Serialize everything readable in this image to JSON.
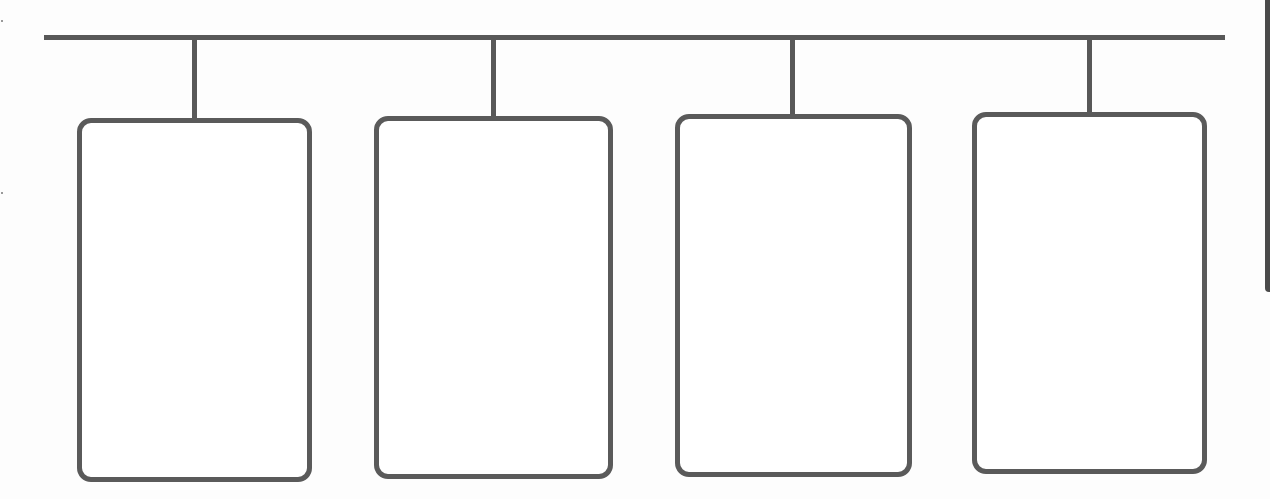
{
  "diagram": {
    "type": "org-chart-template",
    "colors": {
      "line": "#585858",
      "box_border": "#5a5a5a",
      "box_fill": "#ffffff",
      "background": "#fdfdfd",
      "edge_strip": "#4a4a4a"
    },
    "root_bar": {
      "x1": 44,
      "x2": 1225,
      "y": 35,
      "thickness": 5
    },
    "nodes": [
      {
        "id": "node-1",
        "label": "",
        "connector_x": 192,
        "box": {
          "x": 77,
          "y": 118,
          "w": 235,
          "h": 364
        }
      },
      {
        "id": "node-2",
        "label": "",
        "connector_x": 491,
        "box": {
          "x": 374,
          "y": 116,
          "w": 239,
          "h": 363
        }
      },
      {
        "id": "node-3",
        "label": "",
        "connector_x": 790,
        "box": {
          "x": 675,
          "y": 114,
          "w": 237,
          "h": 363
        }
      },
      {
        "id": "node-4",
        "label": "",
        "connector_x": 1087,
        "box": {
          "x": 972,
          "y": 112,
          "w": 235,
          "h": 362
        }
      }
    ]
  }
}
